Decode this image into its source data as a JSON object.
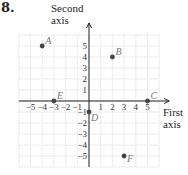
{
  "problem": {
    "number": "8."
  },
  "axes": {
    "y_label_line1": "Second",
    "y_label_line2": "axis",
    "x_label_line1": "First",
    "x_label_line2": "axis"
  },
  "chart_data": {
    "type": "scatter",
    "title": "",
    "xlabel": "First axis",
    "ylabel": "Second axis",
    "xlim": [
      -6,
      6
    ],
    "ylim": [
      -6,
      6
    ],
    "grid": true,
    "x_ticks": [
      -5,
      -4,
      -3,
      -2,
      -1,
      1,
      2,
      3,
      4,
      5
    ],
    "y_ticks": [
      -5,
      -4,
      -3,
      -2,
      -1,
      1,
      2,
      3,
      4,
      5
    ],
    "points": [
      {
        "label": "A",
        "x": -4,
        "y": 5
      },
      {
        "label": "B",
        "x": 2,
        "y": 4
      },
      {
        "label": "C",
        "x": 5,
        "y": 0
      },
      {
        "label": "D",
        "x": 0,
        "y": -1
      },
      {
        "label": "E",
        "x": -3,
        "y": 0
      },
      {
        "label": "F",
        "x": 3,
        "y": -5
      }
    ]
  },
  "colors": {
    "grid": "#cfcfcf",
    "axis": "#222222",
    "point": "#444444",
    "label": "#777777"
  }
}
